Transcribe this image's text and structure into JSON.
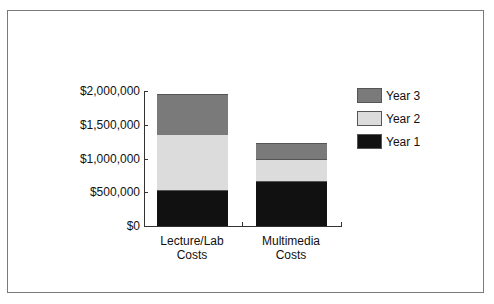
{
  "chart_data": {
    "type": "bar",
    "stacked": true,
    "title": "",
    "xlabel": "",
    "ylabel": "",
    "categories": [
      "Lecture/Lab Costs",
      "Multimedia Costs"
    ],
    "category_lines": [
      [
        "Lecture/Lab",
        "Costs"
      ],
      [
        "Multimedia",
        "Costs"
      ]
    ],
    "series": [
      {
        "name": "Year 1",
        "color": "#111111",
        "values": [
          530000,
          660000
        ]
      },
      {
        "name": "Year 2",
        "color": "#dcdcdc",
        "values": [
          830000,
          330000
        ]
      },
      {
        "name": "Year 3",
        "color": "#7a7a7a",
        "values": [
          600000,
          240000
        ]
      }
    ],
    "ylim": [
      0,
      2000000
    ],
    "yticks": [
      0,
      500000,
      1000000,
      1500000,
      2000000
    ],
    "ytick_labels": [
      "$0",
      "$500,000",
      "$1,000,000",
      "$1,500,000",
      "$2,000,000"
    ],
    "grid": false,
    "legend_position": "right",
    "legend_order": [
      "Year 3",
      "Year 2",
      "Year 1"
    ]
  }
}
